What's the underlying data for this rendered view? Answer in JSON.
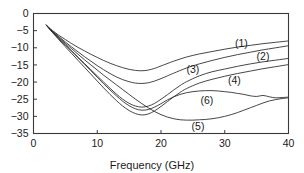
{
  "chart_data": {
    "type": "line",
    "title": "",
    "xlabel": "Frequency (GHz)",
    "ylabel": "",
    "xlim": [
      0,
      40
    ],
    "ylim": [
      -35,
      0
    ],
    "xticks": [
      0,
      10,
      20,
      30,
      40
    ],
    "yticks": [
      0,
      -5,
      -10,
      -15,
      -20,
      -25,
      -30,
      -35
    ],
    "xtick_labels": [
      "0",
      "10",
      "20",
      "30",
      "40"
    ],
    "ytick_labels": [
      "0",
      "−5",
      "−10",
      "−15",
      "−20",
      "−25",
      "−30",
      "−35"
    ],
    "grid": false,
    "legend": "inline-curve-labels",
    "series": [
      {
        "name": "(1)",
        "label": "(1)",
        "label_x": 32.6,
        "label_y": -8.6,
        "x": [
          2,
          3,
          4,
          5,
          6,
          7,
          8,
          9,
          10,
          11,
          12,
          13,
          14,
          15,
          16,
          17,
          18,
          19,
          20,
          22,
          24,
          26,
          28,
          30,
          32,
          34,
          36,
          38,
          40
        ],
        "y": [
          -3.4,
          -5.0,
          -6.4,
          -7.6,
          -8.8,
          -9.9,
          -10.9,
          -11.9,
          -12.8,
          -13.7,
          -14.5,
          -15.2,
          -15.8,
          -16.3,
          -16.6,
          -16.7,
          -16.5,
          -16.0,
          -15.3,
          -13.9,
          -12.7,
          -11.8,
          -11.1,
          -10.4,
          -9.8,
          -9.3,
          -8.8,
          -8.4,
          -8.0
        ]
      },
      {
        "name": "(2)",
        "label": "(2)",
        "label_x": 36.0,
        "label_y": -12.4,
        "x": [
          2,
          3,
          4,
          5,
          6,
          7,
          8,
          9,
          10,
          11,
          12,
          13,
          14,
          15,
          16,
          17,
          18,
          19,
          20,
          21,
          22,
          24,
          26,
          28,
          30,
          32,
          34,
          36,
          38,
          40
        ],
        "y": [
          -3.4,
          -5.2,
          -6.8,
          -8.3,
          -9.8,
          -11.2,
          -12.6,
          -13.9,
          -15.2,
          -16.4,
          -17.5,
          -18.5,
          -19.3,
          -19.9,
          -20.3,
          -20.4,
          -20.2,
          -19.7,
          -19.0,
          -18.2,
          -17.4,
          -15.9,
          -14.7,
          -13.7,
          -12.8,
          -12.0,
          -11.3,
          -10.6,
          -10.0,
          -9.4
        ]
      },
      {
        "name": "(3)",
        "label": "(3)",
        "label_x": 25.0,
        "label_y": -16.2,
        "x": [
          2,
          3,
          4,
          5,
          6,
          7,
          8,
          9,
          10,
          11,
          12,
          13,
          14,
          15,
          16,
          17,
          18,
          19,
          20,
          21,
          22,
          23,
          24,
          26,
          28,
          30,
          32,
          34,
          36,
          38,
          40
        ],
        "y": [
          -3.4,
          -5.5,
          -7.4,
          -9.2,
          -11.0,
          -12.8,
          -14.6,
          -16.4,
          -18.2,
          -20.0,
          -21.8,
          -23.5,
          -25.0,
          -26.2,
          -27.0,
          -27.3,
          -27.0,
          -26.2,
          -25.0,
          -23.7,
          -22.3,
          -21.0,
          -19.9,
          -18.2,
          -17.0,
          -16.2,
          -15.4,
          -14.7,
          -14.1,
          -13.6,
          -13.1
        ]
      },
      {
        "name": "(4)",
        "label": "(4)",
        "label_x": 31.5,
        "label_y": -19.6,
        "x": [
          2,
          3,
          4,
          5,
          6,
          7,
          8,
          9,
          10,
          11,
          12,
          13,
          14,
          15,
          16,
          17,
          18,
          19,
          20,
          21,
          22,
          23,
          24,
          26,
          28,
          30,
          32,
          34,
          36,
          38,
          40
        ],
        "y": [
          -3.4,
          -5.6,
          -7.7,
          -9.7,
          -11.7,
          -13.7,
          -15.7,
          -17.7,
          -19.7,
          -21.7,
          -23.6,
          -25.4,
          -27.0,
          -28.3,
          -29.2,
          -29.6,
          -29.3,
          -28.4,
          -27.1,
          -25.7,
          -24.3,
          -23.0,
          -21.9,
          -20.3,
          -19.2,
          -18.3,
          -17.5,
          -16.8,
          -16.1,
          -15.5,
          -14.9
        ]
      },
      {
        "name": "(5)",
        "label": "(5)",
        "label_x": 25.8,
        "label_y": -33.0,
        "x": [
          2,
          3,
          4,
          5,
          6,
          7,
          8,
          9,
          10,
          11,
          12,
          13,
          14,
          15,
          16,
          17,
          18,
          19,
          20,
          21,
          22,
          23,
          24,
          25,
          26,
          27,
          28,
          29,
          30,
          31,
          32,
          33,
          34,
          35,
          36,
          37,
          38,
          39,
          40
        ],
        "y": [
          -3.4,
          -5.3,
          -7.0,
          -8.7,
          -10.3,
          -11.9,
          -13.5,
          -15.0,
          -16.5,
          -18.0,
          -19.4,
          -20.8,
          -22.2,
          -23.6,
          -25.0,
          -26.3,
          -27.5,
          -28.6,
          -29.5,
          -30.2,
          -30.7,
          -31.0,
          -31.1,
          -31.1,
          -31.0,
          -30.9,
          -30.7,
          -30.4,
          -30.0,
          -29.5,
          -28.9,
          -28.2,
          -27.5,
          -26.8,
          -26.1,
          -25.5,
          -25.1,
          -24.8,
          -24.6
        ]
      },
      {
        "name": "(6)",
        "label": "(6)",
        "label_x": 27.2,
        "label_y": -25.4,
        "x": [
          2,
          3,
          4,
          5,
          6,
          7,
          8,
          9,
          10,
          11,
          12,
          13,
          14,
          15,
          16,
          17,
          18,
          19,
          20,
          21,
          22,
          23,
          24,
          25,
          26,
          27,
          28,
          29,
          30,
          31,
          32,
          33,
          34,
          35,
          36,
          37,
          38,
          39,
          40
        ],
        "y": [
          -3.4,
          -5.4,
          -7.3,
          -9.1,
          -11.0,
          -12.9,
          -14.8,
          -16.7,
          -18.6,
          -20.5,
          -22.3,
          -24.0,
          -25.6,
          -26.9,
          -27.8,
          -28.2,
          -28.0,
          -27.3,
          -26.3,
          -25.2,
          -24.3,
          -23.6,
          -23.1,
          -22.8,
          -22.6,
          -22.5,
          -22.5,
          -22.6,
          -22.8,
          -23.0,
          -23.3,
          -23.6,
          -24.0,
          -24.2,
          -23.9,
          -24.3,
          -24.6,
          -24.5,
          -24.4
        ]
      }
    ]
  },
  "axes": {
    "x_axis_title": "Frequency (GHz)"
  }
}
